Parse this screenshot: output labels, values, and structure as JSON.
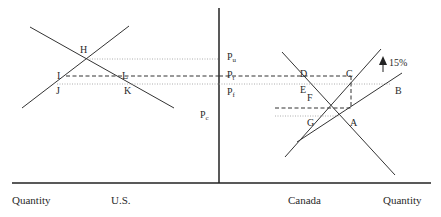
{
  "diagram": {
    "axes": {
      "x_label_left": "Quantity",
      "x_label_right": "Quantity",
      "country_left": "U.S.",
      "country_right": "Canada"
    },
    "price_labels": {
      "pu": {
        "main": "P",
        "sub": "u"
      },
      "pt": {
        "main": "P",
        "sub": "t"
      },
      "pf": {
        "main": "P",
        "sub": "f"
      },
      "pc": {
        "main": "P",
        "sub": "c"
      }
    },
    "points_us": {
      "H": "H",
      "I": "I",
      "L": "L",
      "J": "J",
      "K": "K"
    },
    "points_canada": {
      "D": "D",
      "C": "C",
      "E": "E",
      "F": "F",
      "B": "B",
      "G": "G",
      "A": "A"
    },
    "shift_annotation": "15%",
    "colors": {
      "line": "#333333",
      "dotted": "#888888",
      "dashed": "#333333"
    }
  }
}
